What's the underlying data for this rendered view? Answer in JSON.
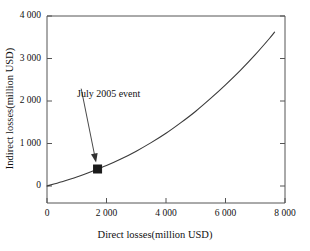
{
  "chart_data": {
    "type": "line",
    "title": "",
    "xlabel": "Direct losses(million USD)",
    "ylabel": "Indirect losses(million USD)",
    "xlim": [
      0,
      8000
    ],
    "ylim": [
      0,
      4000
    ],
    "grid": false,
    "legend": "none",
    "xticks": [
      0,
      2000,
      4000,
      6000,
      8000
    ],
    "xtick_labels": [
      "0",
      "2 000",
      "4 000",
      "6 000",
      "8 000"
    ],
    "yticks": [
      0,
      1000,
      2000,
      3000,
      4000
    ],
    "ytick_labels": [
      "0",
      "1 000",
      "2 000",
      "3 000",
      "4 000"
    ],
    "series": [
      {
        "name": "indirect-vs-direct-losses-curve",
        "color": "#3a3a3a",
        "x": [
          0,
          500,
          1000,
          1500,
          1700,
          2000,
          2500,
          3000,
          3500,
          4000,
          4500,
          5000,
          5500,
          6000,
          6500,
          7000,
          7500,
          7650
        ],
        "y": [
          0,
          100,
          210,
          340,
          400,
          480,
          640,
          820,
          1020,
          1240,
          1490,
          1760,
          2060,
          2380,
          2720,
          3090,
          3490,
          3620
        ]
      }
    ],
    "annotations": [
      {
        "text": "July 2005 event",
        "text_x": 1150,
        "text_y": 2290,
        "point_x": 1700,
        "point_y": 400,
        "marker": "square",
        "marker_color": "#1a1a1a"
      }
    ]
  },
  "axis": {
    "xlabel": "Direct losses(million USD)",
    "ylabel": "Indirect losses(million USD)"
  },
  "xtick_labels": {
    "t0": "0",
    "t1": "2 000",
    "t2": "4 000",
    "t3": "6 000",
    "t4": "8 000"
  },
  "ytick_labels": {
    "t0": "0",
    "t1": "1 000",
    "t2": "2 000",
    "t3": "3 000",
    "t4": "4 000"
  },
  "annotation": {
    "label": "July 2005 event"
  },
  "colors": {
    "curve": "#3a3a3a",
    "frame": "#555555",
    "marker": "#1a1a1a",
    "text": "#111111",
    "background": "#ffffff"
  }
}
